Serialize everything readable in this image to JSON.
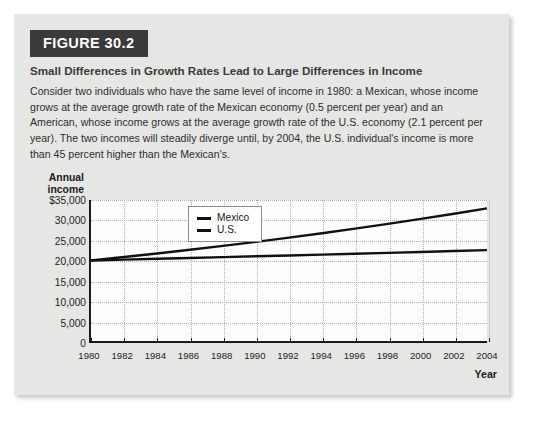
{
  "figure": {
    "badge": "FIGURE 30.2",
    "title": "Small Differences in Growth Rates Lead to Large Differences in Income",
    "caption": "Consider two individuals who have the same level of income in 1980: a Mexican, whose income grows at the average growth rate of the Mexican economy (0.5 percent per year) and an American, whose income grows at the average growth rate of the U.S. economy (2.1 percent per year). The two incomes will steadily diverge until, by 2004, the U.S. individual's income is more than 45 percent higher than the Mexican's."
  },
  "chart_data": {
    "type": "line",
    "title": "Small Differences in Growth Rates Lead to Large Differences in Income",
    "xlabel": "Year",
    "ylabel": "Annual income",
    "ylabel_lines": [
      "Annual",
      "income"
    ],
    "x": [
      1980,
      1982,
      1984,
      1986,
      1988,
      1990,
      1992,
      1994,
      1996,
      1998,
      2000,
      2002,
      2004
    ],
    "xtick_labels": [
      "1980",
      "1982",
      "1984",
      "1986",
      "1988",
      "1990",
      "1992",
      "1994",
      "1996",
      "1998",
      "2000",
      "2002",
      "2004"
    ],
    "xlim": [
      1980,
      2004
    ],
    "ylim": [
      0,
      35000
    ],
    "ytick_values": [
      35000,
      30000,
      25000,
      20000,
      15000,
      10000,
      5000,
      0
    ],
    "ytick_labels": [
      "$35,000",
      "30,000",
      "25,000",
      "20,000",
      "15,000",
      "10,000",
      "5,000",
      "0"
    ],
    "grid": true,
    "legend_position": "upper-left-inside",
    "series": [
      {
        "name": "Mexico",
        "color": "#111111",
        "growth_rate_percent": 0.5,
        "values": [
          20000,
          20201,
          20404,
          20609,
          20815,
          21024,
          21235,
          21448,
          21663,
          21881,
          22100,
          22322,
          22546
        ]
      },
      {
        "name": "U.S.",
        "color": "#111111",
        "growth_rate_percent": 2.1,
        "values": [
          20000,
          20849,
          21733,
          22655,
          23616,
          24618,
          25662,
          26751,
          27886,
          29069,
          30302,
          31588,
          32928
        ]
      }
    ]
  }
}
